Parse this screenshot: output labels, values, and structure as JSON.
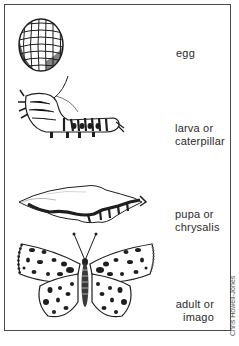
{
  "diagram": {
    "stages": [
      {
        "id": "egg",
        "label_line1": "egg",
        "label_line2": "",
        "icon": "egg-icon"
      },
      {
        "id": "larva",
        "label_line1": "larva or",
        "label_line2": "caterpillar",
        "icon": "caterpillar-icon"
      },
      {
        "id": "pupa",
        "label_line1": "pupa or",
        "label_line2": "chrysalis",
        "icon": "chrysalis-icon"
      },
      {
        "id": "adult",
        "label_line1": "adult or",
        "label_line2": "imago",
        "icon": "butterfly-icon"
      }
    ],
    "credit": "Chris Howell-Jones",
    "colors": {
      "ink": "#1e1e1e",
      "border": "#4a4a4a",
      "background": "#ffffff"
    }
  }
}
